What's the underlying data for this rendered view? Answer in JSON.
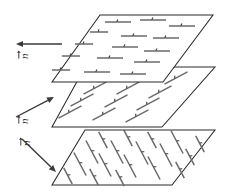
{
  "figure": {
    "background_color": "#ffffff",
    "line_color": "#2b2b2b",
    "rod_color": "#6a6a6a",
    "width": 226,
    "height": 196
  },
  "directors": [
    {
      "id": "director-top",
      "label": "n",
      "accent": "vector-arrow",
      "direction": "left",
      "arrow": {
        "x1": 62,
        "y1": 44,
        "x2": 16,
        "y2": 44
      },
      "label_pos": {
        "x": 28,
        "y": 59
      }
    },
    {
      "id": "director-middle",
      "label": "n",
      "accent": "vector-arrow",
      "direction": "up-right",
      "arrow": {
        "x1": 16,
        "y1": 117,
        "x2": 54,
        "y2": 97
      },
      "label_pos": {
        "x": 28,
        "y": 124
      }
    },
    {
      "id": "director-bottom",
      "label": "n",
      "accent": "vector-arrow",
      "direction": "down-right",
      "arrow": {
        "x1": 22,
        "y1": 139,
        "x2": 56,
        "y2": 172
      },
      "label_pos": {
        "x": 30,
        "y": 146
      }
    }
  ],
  "planes": [
    {
      "id": "plane-top",
      "name": "top-layer",
      "corners": "100,15 213,15 163,82 52,82",
      "rod_orientation": "horizontal",
      "rod_angle_deg": 0,
      "rod_length": 26,
      "rod_count": 14
    },
    {
      "id": "plane-middle",
      "name": "middle-layer",
      "corners": "85,67 215,67 162,127 52,127",
      "rod_orientation": "tilted-up-right",
      "rod_angle_deg": -28,
      "rod_length": 26,
      "rod_count": 16
    },
    {
      "id": "plane-bottom",
      "name": "bottom-layer",
      "corners": "85,130 215,130 172,185 52,185",
      "rod_orientation": "tilted-down-right",
      "rod_angle_deg": 62,
      "rod_length": 26,
      "rod_count": 18
    }
  ],
  "rods": {
    "top": [
      [
        118,
        22
      ],
      [
        153,
        20
      ],
      [
        182,
        26
      ],
      [
        99,
        32
      ],
      [
        134,
        36
      ],
      [
        166,
        38
      ],
      [
        84,
        44
      ],
      [
        125,
        47
      ],
      [
        157,
        51
      ],
      [
        71,
        56
      ],
      [
        110,
        58
      ],
      [
        147,
        62
      ],
      [
        61,
        70
      ],
      [
        97,
        72
      ],
      [
        133,
        74
      ]
    ],
    "middle": [
      [
        110,
        76
      ],
      [
        144,
        74
      ],
      [
        176,
        78
      ],
      [
        200,
        84
      ],
      [
        95,
        88
      ],
      [
        128,
        88
      ],
      [
        160,
        92
      ],
      [
        190,
        96
      ],
      [
        82,
        100
      ],
      [
        116,
        101
      ],
      [
        148,
        104
      ],
      [
        180,
        108
      ],
      [
        70,
        112
      ],
      [
        104,
        114
      ],
      [
        137,
        116
      ],
      [
        170,
        119
      ]
    ],
    "bottom": [
      [
        103,
        140
      ],
      [
        128,
        138
      ],
      [
        152,
        140
      ],
      [
        177,
        142
      ],
      [
        200,
        144
      ],
      [
        92,
        152
      ],
      [
        117,
        152
      ],
      [
        142,
        153
      ],
      [
        166,
        155
      ],
      [
        190,
        157
      ],
      [
        80,
        164
      ],
      [
        105,
        165
      ],
      [
        130,
        166
      ],
      [
        154,
        168
      ],
      [
        180,
        170
      ],
      [
        68,
        176
      ],
      [
        94,
        177
      ],
      [
        120,
        178
      ]
    ]
  }
}
